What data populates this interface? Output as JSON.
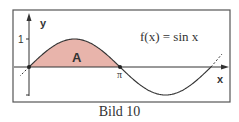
{
  "figure": {
    "function_label": "f(x) = sin x",
    "area_label": "A",
    "x_axis_label": "x",
    "y_axis_label": "y",
    "y_tick_label": "1",
    "pi_label": "π",
    "caption": "Bild 10",
    "fill_color": "#e8b4ab",
    "line_color": "#333333"
  }
}
